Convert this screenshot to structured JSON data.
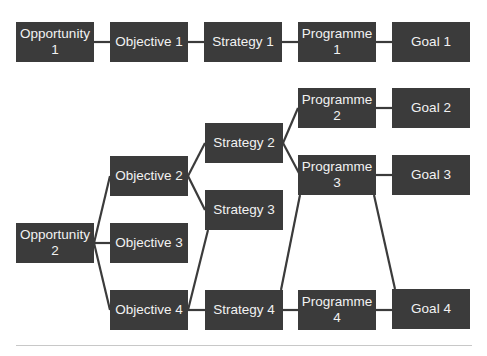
{
  "diagram": {
    "type": "flow-diagram",
    "colors": {
      "node_fill": "#3b3b3b",
      "node_text": "#f2f2f2",
      "link": "#3b3b3b",
      "background": "#ffffff"
    },
    "nodes": {
      "opp1": {
        "label": "Opportunity 1",
        "x": 16,
        "y": 22
      },
      "obj1": {
        "label": "Objective 1",
        "x": 110,
        "y": 22
      },
      "str1": {
        "label": "Strategy 1",
        "x": 204,
        "y": 22
      },
      "prog1": {
        "label": "Programme 1",
        "x": 298,
        "y": 22
      },
      "goal1": {
        "label": "Goal 1",
        "x": 392,
        "y": 22
      },
      "prog2": {
        "label": "Programme 2",
        "x": 298,
        "y": 88
      },
      "goal2": {
        "label": "Goal 2",
        "x": 392,
        "y": 88
      },
      "str2": {
        "label": "Strategy 2",
        "x": 205,
        "y": 123
      },
      "obj2": {
        "label": "Objective 2",
        "x": 110,
        "y": 156
      },
      "prog3": {
        "label": "Programme 3",
        "x": 298,
        "y": 155
      },
      "goal3": {
        "label": "Goal 3",
        "x": 392,
        "y": 155
      },
      "str3": {
        "label": "Strategy 3",
        "x": 205,
        "y": 190
      },
      "opp2": {
        "label": "Opportunity 2",
        "x": 16,
        "y": 223
      },
      "obj3": {
        "label": "Objective 3",
        "x": 110,
        "y": 223
      },
      "obj4": {
        "label": "Objective 4",
        "x": 110,
        "y": 290
      },
      "str4": {
        "label": "Strategy 4",
        "x": 205,
        "y": 290
      },
      "prog4": {
        "label": "Programme 4",
        "x": 298,
        "y": 290
      },
      "goal4": {
        "label": "Goal 4",
        "x": 392,
        "y": 289
      }
    },
    "edges": [
      [
        "opp1",
        "obj1"
      ],
      [
        "obj1",
        "str1"
      ],
      [
        "str1",
        "prog1"
      ],
      [
        "prog1",
        "goal1"
      ],
      [
        "opp2",
        "obj2"
      ],
      [
        "opp2",
        "obj3"
      ],
      [
        "opp2",
        "obj4"
      ],
      [
        "obj2",
        "str2"
      ],
      [
        "obj2",
        "str3"
      ],
      [
        "obj4",
        "str3"
      ],
      [
        "obj4",
        "str4"
      ],
      [
        "str2",
        "prog2"
      ],
      [
        "str2",
        "prog3"
      ],
      [
        "str4",
        "prog3"
      ],
      [
        "str4",
        "prog4"
      ],
      [
        "prog2",
        "goal2"
      ],
      [
        "prog3",
        "goal3"
      ],
      [
        "prog3",
        "goal4"
      ],
      [
        "prog4",
        "goal4"
      ]
    ]
  }
}
